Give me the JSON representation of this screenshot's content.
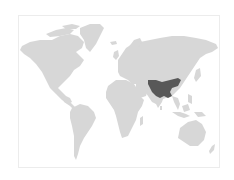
{
  "map": {
    "type": "world-distribution-map",
    "projection": "equirectangular-like",
    "highlighted_region": "South Asia / Himalayan region (northern India, Nepal, Bhutan, Bangladesh, Myanmar, southern China)",
    "colors": {
      "background": "#ffffff",
      "frame_border": "#ececec",
      "land": "#d7d7d7",
      "highlight": "#585858"
    },
    "labels": []
  }
}
